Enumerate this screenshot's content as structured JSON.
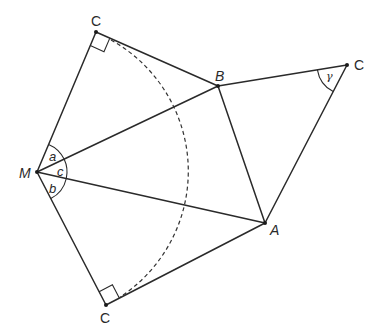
{
  "diagram": {
    "points": {
      "M": {
        "label": "M"
      },
      "A": {
        "label": "A"
      },
      "B": {
        "label": "B"
      },
      "C_top": {
        "label": "C"
      },
      "C_right": {
        "label": "C"
      },
      "C_bottom": {
        "label": "C"
      }
    },
    "angles": {
      "a": {
        "label": "a"
      },
      "b": {
        "label": "b"
      },
      "c": {
        "label": "c"
      },
      "gamma": {
        "label": "γ"
      }
    },
    "segments": [
      [
        "M",
        "C_top"
      ],
      [
        "C_top",
        "B"
      ],
      [
        "M",
        "B"
      ],
      [
        "B",
        "C_right"
      ],
      [
        "C_right",
        "A"
      ],
      [
        "B",
        "A"
      ],
      [
        "M",
        "A"
      ],
      [
        "M",
        "C_bottom"
      ],
      [
        "C_bottom",
        "A"
      ]
    ],
    "right_angles": [
      "C_top",
      "C_bottom"
    ],
    "dashed_arc": {
      "center": "M",
      "from": "C_top",
      "to": "C_bottom"
    }
  }
}
